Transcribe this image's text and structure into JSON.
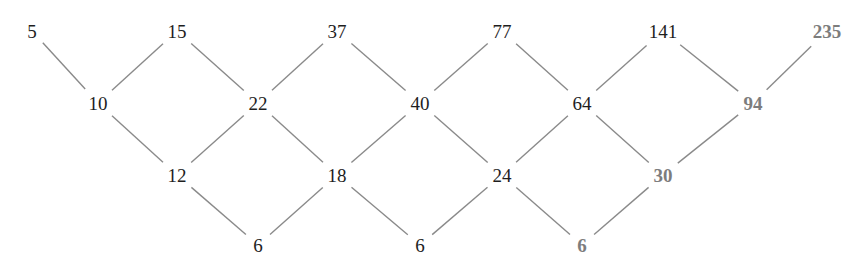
{
  "diagram": {
    "type": "difference-lattice",
    "colors": {
      "normal": "#1e1e1e",
      "highlighted": "#7d7d7d",
      "edge": "#8a8a8a"
    },
    "rows": [
      {
        "y": 31,
        "nodes": [
          {
            "id": "r0c0",
            "value": "5",
            "x": 32,
            "highlight": false
          },
          {
            "id": "r0c1",
            "value": "15",
            "x": 177,
            "highlight": false
          },
          {
            "id": "r0c2",
            "value": "37",
            "x": 337,
            "highlight": false
          },
          {
            "id": "r0c3",
            "value": "77",
            "x": 502,
            "highlight": false
          },
          {
            "id": "r0c4",
            "value": "141",
            "x": 663,
            "highlight": false
          },
          {
            "id": "r0c5",
            "value": "235",
            "x": 827,
            "highlight": true
          }
        ]
      },
      {
        "y": 103,
        "nodes": [
          {
            "id": "r1c0",
            "value": "10",
            "x": 98,
            "highlight": false
          },
          {
            "id": "r1c1",
            "value": "22",
            "x": 258,
            "highlight": false
          },
          {
            "id": "r1c2",
            "value": "40",
            "x": 420,
            "highlight": false
          },
          {
            "id": "r1c3",
            "value": "64",
            "x": 582,
            "highlight": false
          },
          {
            "id": "r1c4",
            "value": "94",
            "x": 753,
            "highlight": true
          }
        ]
      },
      {
        "y": 175,
        "nodes": [
          {
            "id": "r2c0",
            "value": "12",
            "x": 177,
            "highlight": false
          },
          {
            "id": "r2c1",
            "value": "18",
            "x": 337,
            "highlight": false
          },
          {
            "id": "r2c2",
            "value": "24",
            "x": 502,
            "highlight": false
          },
          {
            "id": "r2c3",
            "value": "30",
            "x": 663,
            "highlight": true
          }
        ]
      },
      {
        "y": 245,
        "nodes": [
          {
            "id": "r3c0",
            "value": "6",
            "x": 258,
            "highlight": false
          },
          {
            "id": "r3c1",
            "value": "6",
            "x": 420,
            "highlight": false
          },
          {
            "id": "r3c2",
            "value": "6",
            "x": 582,
            "highlight": true
          }
        ]
      }
    ],
    "edges": [
      [
        "r0c0",
        "r1c0"
      ],
      [
        "r0c1",
        "r1c0"
      ],
      [
        "r0c1",
        "r1c1"
      ],
      [
        "r0c2",
        "r1c1"
      ],
      [
        "r0c2",
        "r1c2"
      ],
      [
        "r0c3",
        "r1c2"
      ],
      [
        "r0c3",
        "r1c3"
      ],
      [
        "r0c4",
        "r1c3"
      ],
      [
        "r0c4",
        "r1c4"
      ],
      [
        "r0c5",
        "r1c4"
      ],
      [
        "r1c0",
        "r2c0"
      ],
      [
        "r1c1",
        "r2c0"
      ],
      [
        "r1c1",
        "r2c1"
      ],
      [
        "r1c2",
        "r2c1"
      ],
      [
        "r1c2",
        "r2c2"
      ],
      [
        "r1c3",
        "r2c2"
      ],
      [
        "r1c3",
        "r2c3"
      ],
      [
        "r1c4",
        "r2c3"
      ],
      [
        "r2c0",
        "r3c0"
      ],
      [
        "r2c1",
        "r3c0"
      ],
      [
        "r2c1",
        "r3c1"
      ],
      [
        "r2c2",
        "r3c1"
      ],
      [
        "r2c2",
        "r3c2"
      ],
      [
        "r2c3",
        "r3c2"
      ]
    ]
  }
}
